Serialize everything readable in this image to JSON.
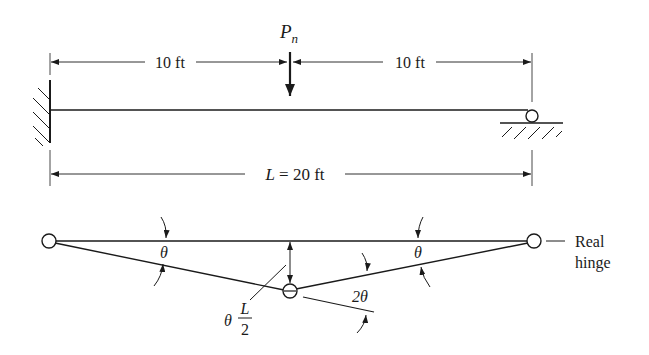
{
  "figure": {
    "beam": {
      "load_label": "P",
      "load_subscript": "n",
      "dim_left": "10 ft",
      "dim_right": "10 ft",
      "dim_total_var": "L",
      "dim_total_rest": " = 20 ft",
      "left_support": "fixed",
      "right_support": "roller"
    },
    "mechanism": {
      "theta_left": "θ",
      "theta_right": "θ",
      "rotation_center": "2θ",
      "deflection_theta": "θ",
      "deflection_num": "L",
      "deflection_den": "2",
      "real_hinge_line1": "Real",
      "real_hinge_line2": "hinge"
    },
    "colors": {
      "ink": "#1a1a1a",
      "background": "#ffffff"
    }
  }
}
